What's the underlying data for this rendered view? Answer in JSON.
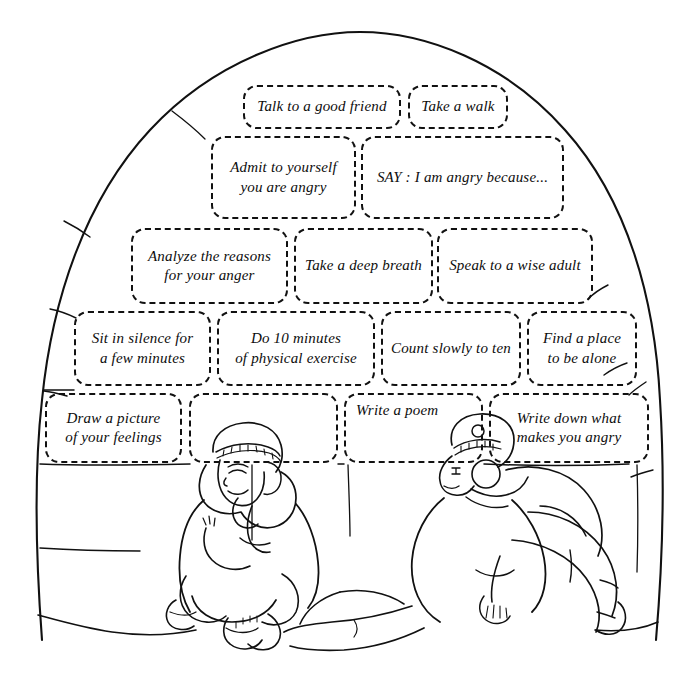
{
  "illustration": {
    "title": "Anger management strategies written on igloo snow blocks",
    "scene_description": "Line drawing of an igloo dome; two children in parkas sit and recline in front of it",
    "line_color": "#111111",
    "background_color": "#ffffff",
    "figures": [
      {
        "name": "seated-child-left",
        "pose": "sitting cross-legged, head resting on hand, eyes closed"
      },
      {
        "name": "reclining-child-right",
        "pose": "leaning back, legs bent, looking upward"
      }
    ]
  },
  "strategies": {
    "rows": [
      {
        "row": 1,
        "blocks": [
          {
            "id": "talk-to-a-good-friend",
            "text": "Talk to a good friend",
            "x": 243,
            "y": 85,
            "w": 158,
            "h": 44
          },
          {
            "id": "take-a-walk",
            "text": "Take a walk",
            "x": 408,
            "y": 85,
            "w": 100,
            "h": 44
          }
        ]
      },
      {
        "row": 2,
        "blocks": [
          {
            "id": "admit-to-yourself",
            "text": "Admit to yourself\nyou are angry",
            "x": 211,
            "y": 136,
            "w": 145,
            "h": 83
          },
          {
            "id": "say-i-am-angry-because",
            "text": "SAY : I am angry because...",
            "x": 361,
            "y": 136,
            "w": 203,
            "h": 83
          }
        ]
      },
      {
        "row": 3,
        "blocks": [
          {
            "id": "analyze-the-reasons",
            "text": "Analyze the reasons\nfor your anger",
            "x": 131,
            "y": 228,
            "w": 157,
            "h": 76
          },
          {
            "id": "take-a-deep-breath",
            "text": "Take a deep breath",
            "x": 294,
            "y": 228,
            "w": 139,
            "h": 76
          },
          {
            "id": "speak-to-a-wise-adult",
            "text": "Speak to a wise adult",
            "x": 437,
            "y": 228,
            "w": 156,
            "h": 76
          }
        ]
      },
      {
        "row": 4,
        "blocks": [
          {
            "id": "sit-in-silence",
            "text": "Sit in silence for\na few minutes",
            "x": 74,
            "y": 311,
            "w": 137,
            "h": 75
          },
          {
            "id": "do-10-minutes-exercise",
            "text": "Do  10 minutes\nof physical exercise",
            "x": 217,
            "y": 311,
            "w": 158,
            "h": 75
          },
          {
            "id": "count-slowly-to-ten",
            "text": "Count slowly to ten",
            "x": 381,
            "y": 311,
            "w": 140,
            "h": 75
          },
          {
            "id": "find-a-place-to-be-alone",
            "text": "Find a place\nto be alone",
            "x": 527,
            "y": 311,
            "w": 110,
            "h": 75
          }
        ]
      },
      {
        "row": 5,
        "blocks": [
          {
            "id": "draw-a-picture",
            "text": "Draw a picture\nof your feelings",
            "x": 45,
            "y": 393,
            "w": 137,
            "h": 70
          },
          {
            "id": "blank-block-behind-child",
            "text": "",
            "x": 189,
            "y": 393,
            "w": 149,
            "h": 70
          },
          {
            "id": "write-a-poem",
            "text": "Write a poem",
            "x": 344,
            "y": 393,
            "w": 139,
            "h": 70
          },
          {
            "id": "write-down-what-makes-you-angry",
            "text": "Write down what\nmakes you angry",
            "x": 489,
            "y": 393,
            "w": 160,
            "h": 70
          }
        ]
      }
    ]
  }
}
